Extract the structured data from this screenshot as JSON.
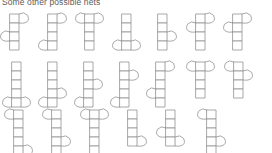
{
  "page": {
    "title": "Some other possible nets",
    "title_color": "#5b5b5b",
    "background_color": "#ffffff",
    "line_color": "#8b8b8b",
    "fill_color": "#ffffff"
  },
  "diagram": {
    "name": "possible-nets-grid",
    "kind": "geometric-nets",
    "row_count": 3,
    "nets_per_row": [
      7,
      7,
      6
    ],
    "total_nets": 20,
    "cell_size": 9,
    "rows": [
      {
        "index": 0,
        "y": 14,
        "nets": [
          {
            "x": 10,
            "squares": 4,
            "flaps": [
              {
                "side": "right",
                "row": 0
              },
              {
                "side": "left",
                "row": 2
              }
            ]
          },
          {
            "x": 48,
            "squares": 4,
            "flaps": [
              {
                "side": "right",
                "row": 0
              },
              {
                "side": "left",
                "row": 3
              }
            ]
          },
          {
            "x": 85,
            "squares": 4,
            "flaps": [
              {
                "side": "left",
                "row": 0
              },
              {
                "side": "right",
                "row": 0
              }
            ]
          },
          {
            "x": 122,
            "squares": 4,
            "flaps": [
              {
                "side": "left",
                "row": 3
              },
              {
                "side": "right",
                "row": 3
              }
            ]
          },
          {
            "x": 158,
            "squares": 4,
            "flaps": [
              {
                "side": "right",
                "row": 2
              }
            ]
          },
          {
            "x": 196,
            "squares": 4,
            "flaps": [
              {
                "side": "right",
                "row": 0
              },
              {
                "side": "left",
                "row": 1
              }
            ]
          },
          {
            "x": 233,
            "squares": 4,
            "flaps": [
              {
                "side": "right",
                "row": 0
              },
              {
                "side": "left",
                "row": 1
              }
            ]
          }
        ]
      },
      {
        "index": 1,
        "y": 62,
        "nets": [
          {
            "x": 12,
            "squares": 5,
            "flaps": [
              {
                "side": "left",
                "row": 4
              },
              {
                "side": "right",
                "row": 4
              }
            ]
          },
          {
            "x": 48,
            "squares": 5,
            "flaps": [
              {
                "side": "left",
                "row": 4
              },
              {
                "side": "right",
                "row": 3
              }
            ]
          },
          {
            "x": 84,
            "squares": 5,
            "flaps": [
              {
                "side": "left",
                "row": 4
              },
              {
                "side": "right",
                "row": 2
              }
            ]
          },
          {
            "x": 120,
            "squares": 5,
            "flaps": [
              {
                "side": "left",
                "row": 4
              },
              {
                "side": "right",
                "row": 1
              }
            ]
          },
          {
            "x": 156,
            "squares": 5,
            "flaps": [
              {
                "side": "left",
                "row": 3
              },
              {
                "side": "right",
                "row": 0
              }
            ]
          },
          {
            "x": 196,
            "squares": 4,
            "flaps": [
              {
                "side": "left",
                "row": 0
              },
              {
                "side": "right",
                "row": 0
              }
            ]
          },
          {
            "x": 234,
            "squares": 4,
            "flaps": [
              {
                "side": "left",
                "row": 0
              },
              {
                "side": "right",
                "row": 1
              }
            ]
          }
        ]
      },
      {
        "index": 2,
        "y": 110,
        "nets": [
          {
            "x": 14,
            "squares": 5,
            "flaps": [
              {
                "side": "left",
                "row": 0
              },
              {
                "side": "right",
                "row": 4
              }
            ]
          },
          {
            "x": 52,
            "squares": 5,
            "flaps": [
              {
                "side": "left",
                "row": 0
              },
              {
                "side": "right",
                "row": 3
              }
            ]
          },
          {
            "x": 90,
            "squares": 5,
            "flaps": [
              {
                "side": "left",
                "row": 0
              },
              {
                "side": "right",
                "row": 0
              }
            ]
          },
          {
            "x": 128,
            "squares": 4,
            "flaps": [
              {
                "side": "right",
                "row": 3
              }
            ]
          },
          {
            "x": 166,
            "squares": 4,
            "flaps": [
              {
                "side": "left",
                "row": 2
              },
              {
                "side": "right",
                "row": 3
              }
            ]
          },
          {
            "x": 207,
            "squares": 5,
            "flaps": [
              {
                "side": "left",
                "row": 0
              },
              {
                "side": "right",
                "row": 3
              }
            ]
          }
        ]
      }
    ]
  }
}
